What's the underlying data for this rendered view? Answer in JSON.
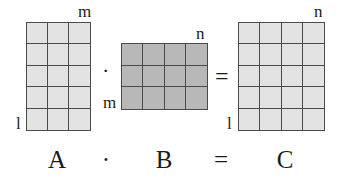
{
  "matrices": [
    {
      "id": "A",
      "rows": 5,
      "cols": 3,
      "row_label": "l",
      "col_label": "m",
      "fill": "#e3e3e3"
    },
    {
      "id": "B",
      "rows": 3,
      "cols": 4,
      "row_label": "m",
      "col_label": "n",
      "fill": "#b8b8b8"
    },
    {
      "id": "C",
      "rows": 5,
      "cols": 4,
      "row_label": "l",
      "col_label": "n",
      "fill": "#e3e3e3"
    }
  ],
  "operators": {
    "multiply": "·",
    "equals": "="
  },
  "equation": {
    "a": "A",
    "dot": "·",
    "b": "B",
    "eq": "=",
    "c": "C"
  }
}
